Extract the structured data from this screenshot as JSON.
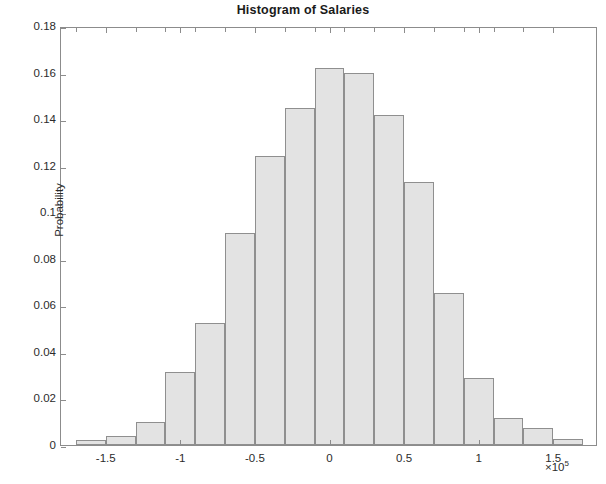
{
  "chart_data": {
    "type": "bar",
    "title": "Histogram of Salaries",
    "xlabel": "",
    "ylabel": "Probability",
    "x_exponent_label": "×10⁵",
    "x_multiplier": 100000,
    "xlim": [
      -180000,
      180000
    ],
    "ylim": [
      0,
      0.18
    ],
    "grid": false,
    "legend": null,
    "bin_width": 20000,
    "bar_fill_color": "#e3e3e3",
    "bar_edge_color": "#8f8f8f",
    "axis_color": "#8c8c8c",
    "y_ticks": [
      0,
      0.02,
      0.04,
      0.06,
      0.08,
      0.1,
      0.12,
      0.14,
      0.16,
      0.18
    ],
    "y_tick_labels": [
      "0",
      "0.02",
      "0.04",
      "0.06",
      "0.08",
      "0.1",
      "0.12",
      "0.14",
      "0.16",
      "0.18"
    ],
    "x_ticks": [
      -150000,
      -100000,
      -50000,
      0,
      50000,
      100000,
      150000
    ],
    "x_tick_labels": [
      "-1.5",
      "-1",
      "-0.5",
      "0",
      "0.5",
      "1",
      "1.5"
    ],
    "bins": [
      {
        "left": -170000,
        "right": -150000,
        "center": -160000,
        "value": 0.0022
      },
      {
        "left": -150000,
        "right": -130000,
        "center": -140000,
        "value": 0.004
      },
      {
        "left": -130000,
        "right": -110000,
        "center": -120000,
        "value": 0.0098
      },
      {
        "left": -110000,
        "right": -90000,
        "center": -100000,
        "value": 0.0312
      },
      {
        "left": -90000,
        "right": -70000,
        "center": -80000,
        "value": 0.0525
      },
      {
        "left": -70000,
        "right": -50000,
        "center": -60000,
        "value": 0.0912
      },
      {
        "left": -50000,
        "right": -30000,
        "center": -40000,
        "value": 0.1242
      },
      {
        "left": -30000,
        "right": -10000,
        "center": -20000,
        "value": 0.1448
      },
      {
        "left": -10000,
        "right": 10000,
        "center": 0,
        "value": 0.162
      },
      {
        "left": 10000,
        "right": 30000,
        "center": 20000,
        "value": 0.1598
      },
      {
        "left": 30000,
        "right": 50000,
        "center": 40000,
        "value": 0.1418
      },
      {
        "left": 50000,
        "right": 70000,
        "center": 60000,
        "value": 0.1128
      },
      {
        "left": 70000,
        "right": 90000,
        "center": 80000,
        "value": 0.0652
      },
      {
        "left": 90000,
        "right": 110000,
        "center": 100000,
        "value": 0.0288
      },
      {
        "left": 110000,
        "right": 130000,
        "center": 120000,
        "value": 0.0118
      },
      {
        "left": 130000,
        "right": 150000,
        "center": 140000,
        "value": 0.0072
      },
      {
        "left": 150000,
        "right": 170000,
        "center": 160000,
        "value": 0.0026
      }
    ]
  }
}
